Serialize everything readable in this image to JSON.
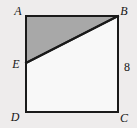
{
  "figure": {
    "kind": "geometry-diagram",
    "background_color": "#eeecec",
    "square": {
      "fill_color": "#f8f8f8",
      "stroke_color": "#1a1a1a",
      "stroke_width": 2,
      "top_left": {
        "x": 26,
        "y": 16
      },
      "top_right": {
        "x": 118,
        "y": 16
      },
      "bottom_right": {
        "x": 118,
        "y": 112
      },
      "bottom_left": {
        "x": 26,
        "y": 112
      }
    },
    "shaded_triangle": {
      "fill_color": "#a8a8a8",
      "stroke_color": "#1a1a1a",
      "stroke_width": 2,
      "points": "26,16 118,16 26,63"
    },
    "point_e": {
      "x": 26,
      "y": 63
    },
    "diagonal_segment": {
      "from": "E",
      "to": "B",
      "stroke_color": "#1a1a1a",
      "stroke_width": 2
    },
    "vertex_labels": {
      "a": "A",
      "b": "B",
      "c": "C",
      "d": "D",
      "e": "E"
    },
    "side_labels": {
      "bc_length": "8"
    }
  }
}
